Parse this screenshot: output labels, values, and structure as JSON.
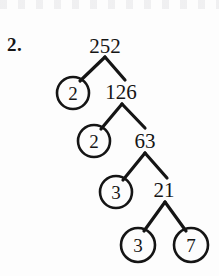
{
  "page": {
    "problem_number": "2.",
    "width": 219,
    "height": 276,
    "ink_color": "#151515",
    "background_color": "#fdfdfd"
  },
  "diagram": {
    "type": "factor-tree",
    "root_value": "252",
    "composites": [
      {
        "value": "252",
        "cx": 105,
        "cy": 46
      },
      {
        "value": "126",
        "cx": 121,
        "cy": 92
      },
      {
        "value": "63",
        "cx": 145,
        "cy": 141
      },
      {
        "value": "21",
        "cx": 164,
        "cy": 190
      }
    ],
    "primes": [
      {
        "value": "2",
        "cx": 73,
        "cy": 93,
        "r": 16
      },
      {
        "value": "2",
        "cx": 94,
        "cy": 141,
        "r": 16
      },
      {
        "value": "3",
        "cx": 116,
        "cy": 192,
        "r": 16
      },
      {
        "value": "3",
        "cx": 138,
        "cy": 245,
        "r": 17
      },
      {
        "value": "7",
        "cx": 191,
        "cy": 245,
        "r": 17
      }
    ],
    "branches": [
      {
        "from": "252",
        "to": "2",
        "x1": 105,
        "y1": 57,
        "x2": 80,
        "y2": 81
      },
      {
        "from": "252",
        "to": "126",
        "x1": 105,
        "y1": 57,
        "x2": 125,
        "y2": 80
      },
      {
        "from": "126",
        "to": "2",
        "x1": 122,
        "y1": 104,
        "x2": 101,
        "y2": 129
      },
      {
        "from": "126",
        "to": "63",
        "x1": 122,
        "y1": 104,
        "x2": 145,
        "y2": 128
      },
      {
        "from": "63",
        "to": "3",
        "x1": 145,
        "y1": 153,
        "x2": 123,
        "y2": 180
      },
      {
        "from": "63",
        "to": "21",
        "x1": 145,
        "y1": 153,
        "x2": 167,
        "y2": 178
      },
      {
        "from": "21",
        "to": "3",
        "x1": 165,
        "y1": 202,
        "x2": 144,
        "y2": 231
      },
      {
        "from": "21",
        "to": "7",
        "x1": 165,
        "y1": 202,
        "x2": 186,
        "y2": 231
      }
    ],
    "factorization": "252 = 2 x 2 x 3 x 3 x 7"
  }
}
